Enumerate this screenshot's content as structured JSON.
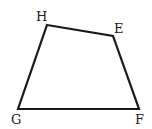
{
  "diagram": {
    "type": "quadrilateral",
    "stroke_color": "#1a1a1a",
    "vertices": [
      {
        "label": "H",
        "x": 47,
        "y": 25,
        "label_x": 36,
        "label_y": 21
      },
      {
        "label": "E",
        "x": 113,
        "y": 36,
        "label_x": 114,
        "label_y": 33
      },
      {
        "label": "F",
        "x": 139,
        "y": 109,
        "label_x": 135,
        "label_y": 124
      },
      {
        "label": "G",
        "x": 18,
        "y": 109,
        "label_x": 11,
        "label_y": 124
      }
    ]
  }
}
